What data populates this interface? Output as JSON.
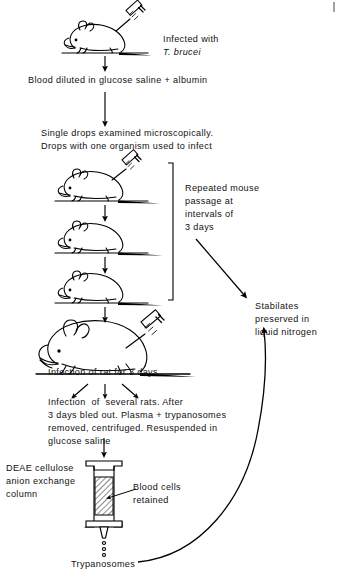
{
  "diagram": {
    "type": "flowchart",
    "steps": {
      "infected_with_line1": "Infected with",
      "infected_with_species": "T. brucei",
      "blood_diluted": "Blood diluted in glucose saline + albumin",
      "single_drops_line1": "Single drops examined microscopically.",
      "single_drops_line2": "Drops with one organism used to infect",
      "repeated_passage_line1": "Repeated mouse",
      "repeated_passage_line2": "passage at",
      "repeated_passage_line3": "intervals of",
      "repeated_passage_line4": "3 days",
      "stabilates_line1": "Stabilates",
      "stabilates_line2": "preserved in",
      "stabilates_line3": "liquid nitrogen",
      "infection_rat": "Infection of rat for 3 days",
      "several_rats_line1": "Infection  of  several rats. After",
      "several_rats_line2": "3 days bled out. Plasma + trypanosomes",
      "several_rats_line3": "removed, centrifuged. Resuspended in",
      "several_rats_line4": "glucose saline",
      "column_label_line1": "DEAE cellulose",
      "column_label_line2": "anion exchange",
      "column_label_line3": "column",
      "blood_cells_line1": "Blood cells",
      "blood_cells_line2": "retained",
      "trypanosomes": "Trypanosomes"
    },
    "figures": {
      "mouse_injected": "mouse-with-syringe-illustration",
      "mouse_passage_1": "mouse-with-syringe-illustration",
      "mouse_passage_2": "mouse-illustration",
      "mouse_passage_3": "mouse-illustration",
      "rat_injected": "rat-with-syringe-illustration",
      "column": "deae-cellulose-column-illustration"
    },
    "colors": {
      "ink": "#000000",
      "background": "#ffffff"
    }
  }
}
